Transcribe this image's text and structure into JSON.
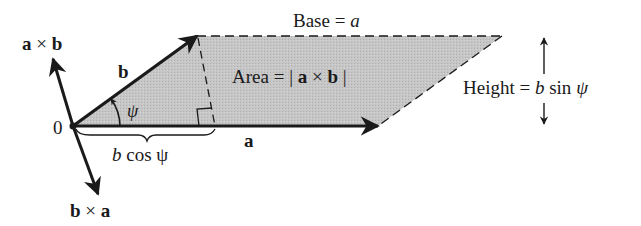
{
  "colors": {
    "fill": "#c4c4c4",
    "stroke": "#1a1a1a",
    "background": "#ffffff"
  },
  "labels": {
    "base": "Base = a",
    "area": "Area = | a × b |",
    "height": "Height = b sin ψ",
    "b_cos_psi": "b cos ψ",
    "vector_a": "a",
    "vector_b": "b",
    "origin": "0",
    "psi": "ψ",
    "a_cross_b": "a × b",
    "b_cross_a": "b × a"
  },
  "parts": {
    "base_word": "Base",
    "base_eq": "=",
    "base_var": "a",
    "area_word": "Area",
    "area_eq": "=",
    "area_bar_l": "|",
    "area_a": "a",
    "area_times": "×",
    "area_b": "b",
    "area_bar_r": "|",
    "height_word": "Height",
    "height_eq": "=",
    "height_b": "b",
    "height_sin": "sin",
    "height_psi": "ψ",
    "bcos_b": "b",
    "bcos_cos": "cos",
    "bcos_psi": "ψ",
    "axb_a": "a",
    "axb_times": "×",
    "axb_b": "b",
    "bxa_b": "b",
    "bxa_times": "×",
    "bxa_a": "a"
  },
  "geometry": {
    "origin": [
      73,
      126
    ],
    "vector_a_tip": [
      378,
      126
    ],
    "vector_b_tip": [
      197,
      36
    ],
    "top_right_corner": [
      502,
      36
    ],
    "perpendicular_foot": [
      215,
      126
    ],
    "a_cross_b_tip": [
      53,
      59
    ],
    "b_cross_a_tip": [
      98,
      194
    ]
  }
}
